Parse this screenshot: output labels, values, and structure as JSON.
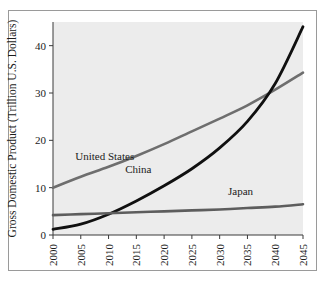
{
  "figure": {
    "background_color": "#ffffff",
    "frame_color": "#9a9a9a",
    "plot_background_color": "#ececec"
  },
  "chart_data": {
    "type": "line",
    "title": "",
    "xlabel": "",
    "ylabel": "Gross Domestic Product (Trillion U.S. Dollars)",
    "xlim": [
      2000,
      2045
    ],
    "ylim": [
      0,
      45
    ],
    "xticks": [
      2000,
      2005,
      2010,
      2015,
      2020,
      2025,
      2030,
      2035,
      2040,
      2045
    ],
    "xtick_labels": [
      "2000",
      "2005",
      "2010",
      "2015",
      "2020",
      "2025",
      "2030",
      "2035",
      "2040",
      "2045"
    ],
    "yticks": [
      0,
      10,
      20,
      30,
      40
    ],
    "ytick_labels": [
      "0",
      "10",
      "20",
      "30",
      "40"
    ],
    "grid": false,
    "legend_position": "inline-labels",
    "x": [
      2000,
      2005,
      2010,
      2015,
      2020,
      2025,
      2030,
      2035,
      2040,
      2045
    ],
    "series": [
      {
        "name": "United States",
        "color": "#6e6e6e",
        "width": 2.6,
        "values": [
          10.0,
          12.3,
          14.4,
          16.7,
          19.2,
          21.9,
          24.6,
          27.4,
          30.7,
          34.3
        ],
        "label": "United States",
        "label_x": 2004.0,
        "label_y": 15.8
      },
      {
        "name": "China",
        "color": "#101010",
        "width": 2.8,
        "values": [
          1.2,
          2.3,
          4.4,
          7.2,
          10.4,
          14.0,
          18.4,
          24.0,
          32.0,
          44.0
        ],
        "label": "China",
        "label_x": 2013.0,
        "label_y": 13.2
      },
      {
        "name": "Japan",
        "color": "#5d5d5d",
        "width": 2.6,
        "values": [
          4.2,
          4.4,
          4.6,
          4.8,
          5.0,
          5.2,
          5.4,
          5.7,
          6.0,
          6.5
        ],
        "label": "Japan",
        "label_x": 2031.5,
        "label_y": 8.4
      }
    ],
    "annotations": [
      {
        "text": "China overtakes the United States around 2036 at about 27 trillion U.S. dollars"
      }
    ]
  }
}
